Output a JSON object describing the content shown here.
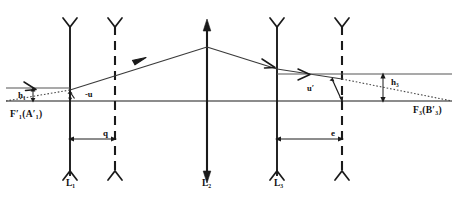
{
  "diagram": {
    "colors": {
      "stroke": "#1a1a1a",
      "axis": "#555555",
      "background": "#ffffff"
    },
    "axis": {
      "name": "optical-axis",
      "y": 101,
      "x_start": 6,
      "x_end": 452
    },
    "elements": [
      {
        "id": "lens-1",
        "label": "L",
        "subscript": "1",
        "label_full": "L₁",
        "style": "solid",
        "x": 70,
        "top": 22,
        "bottom": 176,
        "cap_top": "fork-up",
        "cap_bottom": "fork-up"
      },
      {
        "id": "plane-1-dashed",
        "label": "",
        "style": "dashed",
        "x": 115,
        "top": 22,
        "bottom": 176,
        "cap_top": "fork-up",
        "cap_bottom": "fork-up"
      },
      {
        "id": "lens-2",
        "label": "L",
        "subscript": "2",
        "label_full": "L₂",
        "style": "solid",
        "x": 207,
        "top": 22,
        "bottom": 176,
        "cap_top": "arrow-up",
        "cap_bottom": "arrow-down"
      },
      {
        "id": "lens-3",
        "label": "L",
        "subscript": "3",
        "label_full": "L₃",
        "style": "solid",
        "x": 277,
        "top": 22,
        "bottom": 176,
        "cap_top": "fork-up",
        "cap_bottom": "fork-up"
      },
      {
        "id": "plane-3-dashed",
        "label": "",
        "style": "dashed",
        "x": 342,
        "top": 22,
        "bottom": 176,
        "cap_top": "fork-up",
        "cap_bottom": "fork-up"
      }
    ],
    "labels": {
      "h1": {
        "text": "h",
        "sub": "1",
        "full": "h₁"
      },
      "h3": {
        "text": "h",
        "sub": "3",
        "full": "h₃"
      },
      "u_in": {
        "full": "-u"
      },
      "u_out": {
        "full": "u′"
      },
      "q": {
        "full": "q"
      },
      "e": {
        "full": "e"
      },
      "f1_point": {
        "prefix": "F",
        "sub1": "1",
        "inner": "(A",
        "sub2": "1",
        "suffix": ")",
        "full": "F′₁(A′₁)"
      },
      "f3_point": {
        "prefix": "F",
        "sub1": "3",
        "inner": "(B",
        "sub2": "3",
        "suffix": ")",
        "full": "F₃(B′₃)"
      },
      "l1": {
        "full": "L₁"
      },
      "l2": {
        "full": "L₂"
      },
      "l3": {
        "full": "L₃"
      }
    },
    "dimensions": [
      {
        "id": "dim-q",
        "label": "q",
        "from_x": 70,
        "to_x": 115,
        "y": 139,
        "arrows": "both"
      },
      {
        "id": "dim-e",
        "label": "e",
        "from_x": 277,
        "to_x": 342,
        "y": 139,
        "arrows": "both"
      },
      {
        "id": "dim-h1",
        "label": "h₁",
        "x": 33,
        "from_y": 88,
        "to_y": 101,
        "arrows": "both"
      },
      {
        "id": "dim-h3",
        "label": "h₃",
        "x": 383,
        "from_y": 74,
        "to_y": 101,
        "arrows": "both"
      }
    ],
    "rays": [
      {
        "id": "incoming-marginal-ray",
        "style": "solid",
        "points": "6,88 70,88",
        "arrow_at": 0.72,
        "description": "horizontal entrance ray at height h1"
      },
      {
        "id": "object-ray-dotted",
        "style": "dotted",
        "points": "6,101 70,90",
        "description": "dotted construction ray from F'1(A'1) to lens 1"
      },
      {
        "id": "ray-l1-to-l2",
        "style": "solid",
        "points": "70,90 207,47",
        "arrow_at": 0.55,
        "description": "ray rising from lens 1 to lens 2"
      },
      {
        "id": "ray-l2-to-l3",
        "style": "solid",
        "points": "207,47 277,69",
        "description": "ray descending from lens 2 toward lens 3"
      },
      {
        "id": "ray-l3-exit",
        "style": "solid",
        "points": "277,69 342,79",
        "arrow_at": 0.6,
        "description": "ray continuing past lens 3"
      },
      {
        "id": "ray-out-horizontal",
        "style": "solid",
        "points": "277,74 452,74",
        "arrow_at": 0.42,
        "description": "horizontal exit ray at height h3"
      },
      {
        "id": "ray-to-F3-dotted",
        "style": "dotted",
        "points": "342,79 452,101",
        "description": "dotted ray converging to F3(B'3) on the axis"
      }
    ],
    "angles": [
      {
        "id": "angle-u-in",
        "label": "-u",
        "vertex_x": 70,
        "vertex_y": 101,
        "description": "incidence angle at lens 1"
      },
      {
        "id": "angle-u-out",
        "label": "u′",
        "vertex_x": 342,
        "vertex_y": 101,
        "description": "emergence angle at exit plane"
      }
    ]
  }
}
